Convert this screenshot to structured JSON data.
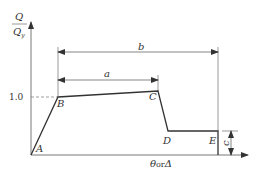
{
  "diagram": {
    "type": "force-deformation backbone curve",
    "y_axis": {
      "label_numerator": "Q",
      "label_denominator": "Qy",
      "tick_label": "1.0"
    },
    "x_axis": {
      "label": "θ or Δ",
      "label_theta": "θ",
      "label_or": "or",
      "label_delta": "Δ"
    },
    "points": [
      {
        "id": "A",
        "label": "A"
      },
      {
        "id": "B",
        "label": "B"
      },
      {
        "id": "C",
        "label": "C"
      },
      {
        "id": "D",
        "label": "D"
      },
      {
        "id": "E",
        "label": "E"
      }
    ],
    "dimensions": {
      "a": "a",
      "b": "b",
      "c": "c"
    },
    "colors": {
      "line": "#333333",
      "axis": "#555555",
      "dashed": "#777777",
      "background": "#ffffff"
    }
  }
}
